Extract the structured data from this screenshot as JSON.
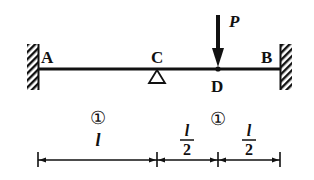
{
  "diagram": {
    "type": "beam",
    "colors": {
      "ink": "#111111",
      "background": "#ffffff"
    },
    "points": {
      "A": {
        "label": "A",
        "support": "fixed-wall-left"
      },
      "C": {
        "label": "C",
        "support": "pin-roller"
      },
      "D": {
        "label": "D",
        "support": "none"
      },
      "B": {
        "label": "B",
        "support": "fixed-wall-right"
      }
    },
    "load": {
      "label": "P",
      "at": "D",
      "direction": "down"
    },
    "segments": [
      {
        "marker": "①",
        "length_label": "l",
        "from": "A",
        "to": "C"
      },
      {
        "marker": "①",
        "from": "C",
        "to": "B"
      }
    ],
    "dimensions": [
      {
        "numerator": "l",
        "denominator": "2",
        "from": "C",
        "to": "D"
      },
      {
        "numerator": "l",
        "denominator": "2",
        "from": "D",
        "to": "B"
      }
    ]
  }
}
